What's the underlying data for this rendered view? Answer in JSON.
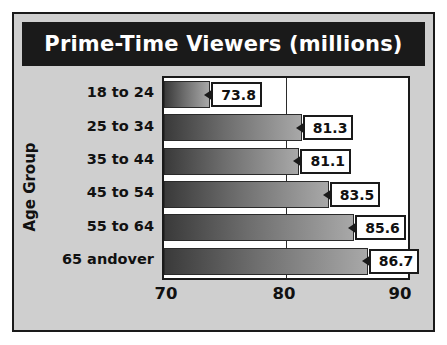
{
  "chart_data": {
    "type": "bar",
    "orientation": "horizontal",
    "title": "Prime-Time Viewers (millions)",
    "xlabel": "",
    "ylabel": "Age Group",
    "categories": [
      "18 to 24",
      "25 to 34",
      "35 to 44",
      "45 to 54",
      "55 to 64",
      "65 and over"
    ],
    "values": [
      73.8,
      81.3,
      81.1,
      83.5,
      85.6,
      86.7
    ],
    "data_labels": [
      "73.8",
      "81.3",
      "81.1",
      "83.5",
      "85.6",
      "86.7"
    ],
    "xlim": [
      70,
      90
    ],
    "xticks": [
      70,
      80,
      90
    ],
    "xtick_labels": [
      "70",
      "80",
      "90"
    ],
    "grid": true,
    "legend": "none",
    "colors": {
      "bar_dark": "#3a3a3a",
      "bar_light": "#a8a8a8",
      "title_bar": "#1a1a1a",
      "title_text": "#ffffff",
      "panel": "#cfcfcf",
      "plot_bg": "#ffffff",
      "axis": "#1a1a1a"
    }
  },
  "category_label_lines": [
    [
      "18 to 24"
    ],
    [
      "25 to 34"
    ],
    [
      "35 to 44"
    ],
    [
      "45 to 54"
    ],
    [
      "55 to 64"
    ],
    [
      "65 and",
      "over"
    ]
  ]
}
